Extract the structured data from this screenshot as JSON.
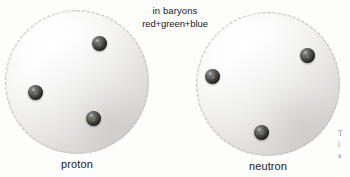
{
  "figure": {
    "background_color": "#fdfdfb",
    "text_color": "#23201e",
    "header": {
      "line1": "in baryons",
      "line2": "red+green+blue"
    },
    "baryons": [
      {
        "name": "proton",
        "label": "proton",
        "sphere": {
          "left": 5,
          "top": 10,
          "size": 144
        },
        "quarks": [
          {
            "label": "u",
            "left": 92,
            "top": 36,
            "size": 15
          },
          {
            "label": "u",
            "left": 28,
            "top": 85,
            "size": 15
          },
          {
            "label": "d",
            "left": 86,
            "top": 111,
            "size": 15
          }
        ]
      },
      {
        "name": "neutron",
        "label": "neutron",
        "sphere": {
          "left": 196,
          "top": 12,
          "size": 144
        },
        "quarks": [
          {
            "label": "d",
            "left": 205,
            "top": 69,
            "size": 15
          },
          {
            "label": "u",
            "left": 300,
            "top": 48,
            "size": 15
          },
          {
            "label": "d",
            "left": 254,
            "top": 125,
            "size": 15
          }
        ]
      }
    ],
    "margin_text": {
      "line1": "T",
      "line2": "i",
      "line3": "a"
    }
  }
}
